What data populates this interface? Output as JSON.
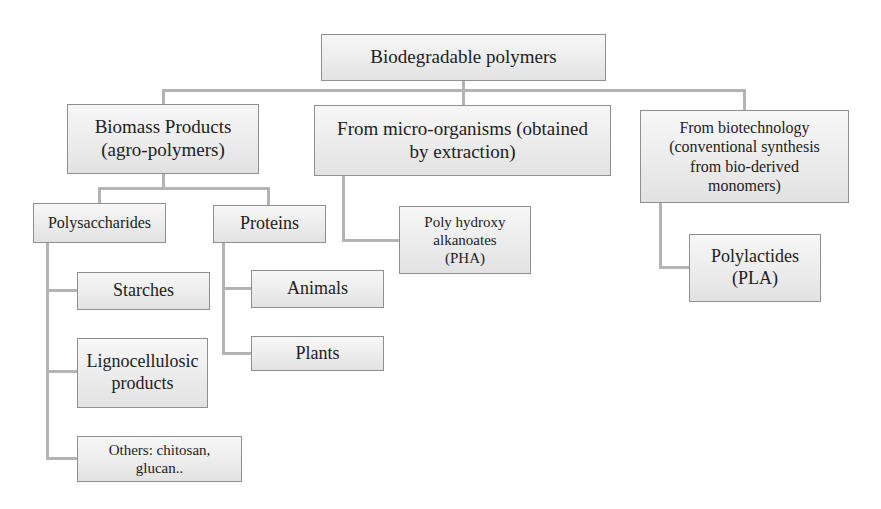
{
  "diagram": {
    "root": {
      "label": "Biodegradable polymers"
    },
    "categories": [
      {
        "label": "Biomass Products\n(agro-polymers)",
        "children": [
          {
            "label": "Polysaccharides",
            "children": [
              {
                "label": "Starches"
              },
              {
                "label": "Lignocellulosic\nproducts"
              },
              {
                "label": "Others: chitosan,\nglucan.."
              }
            ]
          },
          {
            "label": "Proteins",
            "children": [
              {
                "label": "Animals"
              },
              {
                "label": "Plants"
              }
            ]
          }
        ]
      },
      {
        "label": "From micro-organisms (obtained\nby extraction)",
        "children": [
          {
            "label": "Poly hydroxy\nalkanoates\n(PHA)"
          }
        ]
      },
      {
        "label": "From biotechnology\n(conventional synthesis\nfrom bio-derived\nmonomers)",
        "children": [
          {
            "label": "Polylactides\n(PLA)"
          }
        ]
      }
    ]
  },
  "colors": {
    "box_border": "#8f8f8f",
    "box_fill_top": "#f7f7f7",
    "box_fill_bottom": "#e2e2e2",
    "connector": "#b3b3b3",
    "text": "#222222"
  }
}
